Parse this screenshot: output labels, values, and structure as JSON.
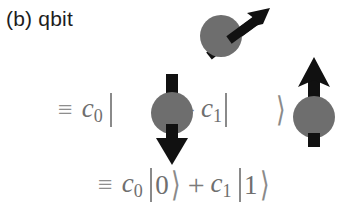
{
  "figure": {
    "panel_label": "(b) qbit",
    "background_color": "#ffffff"
  },
  "colors": {
    "sphere_gray": "#6e6e6e",
    "arrow_black": "#111111",
    "math_gray": "#7b7b7b",
    "label_black": "#1d1d1d"
  },
  "spins": {
    "superposition": {
      "name": "tilted-spin",
      "direction": "up-right-diagonal",
      "angle_deg": 42
    },
    "down": {
      "name": "spin-down",
      "direction": "down"
    },
    "up": {
      "name": "spin-up",
      "direction": "up"
    }
  },
  "equations": {
    "spin_line": {
      "equiv": "≡",
      "coef0": "c",
      "coef0_sub": "0",
      "ket_open": "|",
      "ket_close": "⟩",
      "plus": "+",
      "coef1": "c",
      "coef1_sub": "1",
      "ket_open_2": "|",
      "ket_close_2": "⟩"
    },
    "digit_line": {
      "equiv": "≡",
      "coef0": "c",
      "coef0_sub": "0",
      "ket_open": "|",
      "value0": "0",
      "ket_close": "⟩",
      "plus": "+",
      "coef1": "c",
      "coef1_sub": "1",
      "ket_open_2": "|",
      "value1": "1",
      "ket_close_2": "⟩"
    }
  }
}
